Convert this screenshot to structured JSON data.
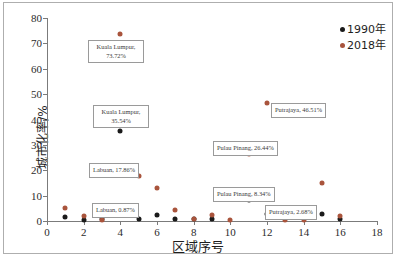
{
  "chart_data": {
    "type": "scatter",
    "title": "",
    "xlabel": "区域序号",
    "ylabel": "城市化率/%",
    "xlim": [
      0,
      18
    ],
    "ylim": [
      0,
      80
    ],
    "xticks": [
      0,
      2,
      4,
      6,
      8,
      10,
      12,
      14,
      16,
      18
    ],
    "yticks": [
      0,
      10,
      20,
      30,
      40,
      50,
      60,
      70,
      80
    ],
    "grid": false,
    "legend_position": "top-right",
    "colors": {
      "s1990": "#1a1a1a",
      "s2018": "#a9543c"
    },
    "series": [
      {
        "name": "1990年",
        "color": "#1a1a1a",
        "points": [
          {
            "x": 1,
            "y": 1.5
          },
          {
            "x": 2,
            "y": 0.5
          },
          {
            "x": 3,
            "y": 0.87
          },
          {
            "x": 4,
            "y": 35.54
          },
          {
            "x": 5,
            "y": 0.8
          },
          {
            "x": 6,
            "y": 2.2
          },
          {
            "x": 7,
            "y": 0.8
          },
          {
            "x": 8,
            "y": 0.6
          },
          {
            "x": 9,
            "y": 0.8
          },
          {
            "x": 11,
            "y": 8.34
          },
          {
            "x": 12,
            "y": 2.7
          },
          {
            "x": 15,
            "y": 2.68
          },
          {
            "x": 16,
            "y": 0.6
          }
        ]
      },
      {
        "name": "2018年",
        "color": "#a9543c",
        "points": [
          {
            "x": 1,
            "y": 5.2
          },
          {
            "x": 2,
            "y": 1.8
          },
          {
            "x": 3,
            "y": 0.5
          },
          {
            "x": 4,
            "y": 73.72
          },
          {
            "x": 5,
            "y": 17.86
          },
          {
            "x": 6,
            "y": 13.2
          },
          {
            "x": 7,
            "y": 4.5
          },
          {
            "x": 8,
            "y": 0.6
          },
          {
            "x": 9,
            "y": 2.2
          },
          {
            "x": 10,
            "y": 0.2
          },
          {
            "x": 11,
            "y": 26.44
          },
          {
            "x": 12,
            "y": 46.51
          },
          {
            "x": 13,
            "y": 0.3
          },
          {
            "x": 14,
            "y": 0.3
          },
          {
            "x": 15,
            "y": 14.9
          },
          {
            "x": 16,
            "y": 2.1
          }
        ]
      }
    ],
    "annotations": [
      {
        "id": "kl-2018",
        "text": "Kuala Lumpur, 73.72%",
        "line1": "Kuala Lumpur,",
        "line2": "73.72%",
        "series": "2018年",
        "x": 4,
        "y": 73.72
      },
      {
        "id": "kl-1990",
        "text": "Kuala Lumpur, 35.54%",
        "line1": "Kuala Lumpur,",
        "line2": "35.54%",
        "series": "1990年",
        "x": 4,
        "y": 35.54
      },
      {
        "id": "labuan-2018",
        "text": "Labuan, 17.86%",
        "series": "2018年",
        "x": 5,
        "y": 17.86
      },
      {
        "id": "labuan-1990",
        "text": "Labuan, 0.87%",
        "series": "1990年",
        "x": 3,
        "y": 0.87
      },
      {
        "id": "putrajaya-2018",
        "text": "Putrajaya, 46.51%",
        "series": "2018年",
        "x": 12,
        "y": 46.51
      },
      {
        "id": "pinang-2018",
        "text": "Pulau Pinang, 26.44%",
        "series": "2018年",
        "x": 11,
        "y": 26.44
      },
      {
        "id": "pinang-1990",
        "text": "Pulau Pinang, 8.34%",
        "series": "1990年",
        "x": 11,
        "y": 8.34
      },
      {
        "id": "putrajaya-1990",
        "text": "Putrajaya, 2.68%",
        "series": "1990年",
        "x": 15,
        "y": 2.68
      }
    ]
  },
  "legend": {
    "items": [
      {
        "label": "1990年",
        "color": "#1a1a1a"
      },
      {
        "label": "2018年",
        "color": "#a9543c"
      }
    ]
  },
  "axes": {
    "x_title": "区域序号",
    "y_title": "城市化率/%",
    "x_ticks": [
      "0",
      "2",
      "4",
      "6",
      "8",
      "10",
      "12",
      "14",
      "16",
      "18"
    ],
    "y_ticks": [
      "0",
      "10",
      "20",
      "30",
      "40",
      "50",
      "60",
      "70",
      "80"
    ]
  },
  "annotation_labels": {
    "kl_2018_l1": "Kuala Lumpur,",
    "kl_2018_l2": "73.72%",
    "kl_1990_l1": "Kuala Lumpur,",
    "kl_1990_l2": "35.54%",
    "labuan_2018": "Labuan, 17.86%",
    "labuan_1990": "Labuan, 0.87%",
    "putrajaya_2018": "Putrajaya, 46.51%",
    "pinang_2018": "Pulau Pinang, 26.44%",
    "pinang_1990": "Pulau Pinang, 8.34%",
    "putrajaya_1990": "Putrajaya, 2.68%"
  }
}
